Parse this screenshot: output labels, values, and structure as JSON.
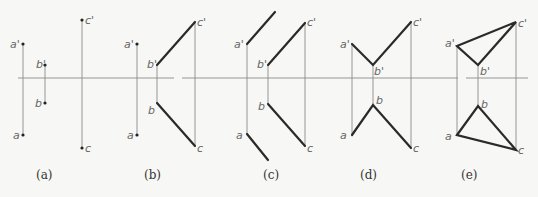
{
  "diagram": {
    "panels": [
      {
        "id": "a",
        "caption": "(a)",
        "labels": {
          "a_prime": "a'",
          "a": "a",
          "b_prime": "b'",
          "b": "b",
          "c_prime": "c'",
          "c": "c"
        }
      },
      {
        "id": "b",
        "caption": "(b)",
        "labels": {
          "a_prime": "a'",
          "a": "a",
          "b_prime": "b'",
          "b": "b",
          "c_prime": "c'",
          "c": "c"
        }
      },
      {
        "id": "c",
        "caption": "(c)",
        "labels": {
          "a_prime": "a'",
          "a": "a",
          "b_prime": "b'",
          "b": "b",
          "c_prime": "c'",
          "c": "c"
        }
      },
      {
        "id": "d",
        "caption": "(d)",
        "labels": {
          "a_prime": "a'",
          "a": "a",
          "b_prime": "b'",
          "b": "b",
          "c_prime": "c'",
          "c": "c"
        }
      },
      {
        "id": "e",
        "caption": "(e)",
        "labels": {
          "a_prime": "a'",
          "a": "a",
          "b_prime": "b'",
          "b": "b",
          "c_prime": "c'",
          "c": "c"
        }
      }
    ],
    "colors": {
      "thin_line": "#8a8a8a",
      "thick_line": "#2a2a2a",
      "label": "#666666",
      "background": "#f7f7f5"
    }
  }
}
